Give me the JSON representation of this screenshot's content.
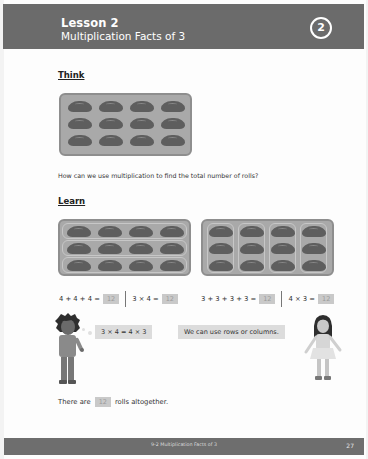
{
  "header": {
    "lesson": "Lesson 2",
    "subtitle": "Multiplication Facts of 3",
    "chapter_number": "2"
  },
  "think": {
    "title": "Think",
    "tray": {
      "rows": 3,
      "columns": 4,
      "item": "roll-icon"
    },
    "question": "How can we use multiplication to find the total number of rolls?"
  },
  "learn": {
    "title": "Learn",
    "rows_tray": {
      "rows": 3,
      "columns": 4,
      "grouping": "rows"
    },
    "columns_tray": {
      "rows": 3,
      "columns": 4,
      "grouping": "columns"
    },
    "equations_left": {
      "addition": "4 + 4 + 4 =",
      "addition_answer": "12",
      "multiplication": "3 × 4 =",
      "multiplication_answer": "12"
    },
    "equations_right": {
      "addition": "3 + 3 + 3 + 3 =",
      "addition_answer": "12",
      "multiplication": "4 × 3 =",
      "multiplication_answer": "12"
    },
    "boy_bubble": "3 × 4 = 4 × 3",
    "girl_bubble": "We can use rows or columns.",
    "sentence_before": "There are",
    "sentence_answer": "12",
    "sentence_after": "rolls altogether."
  },
  "footer": {
    "title": "9-2  Multiplication Facts of 3",
    "page_number": "27"
  },
  "colors": {
    "header_bg": "#6b6b6b",
    "tray_bg": "#a9a9a9",
    "roll": "#5e5e5e",
    "answer_box": "#c9c9c9",
    "bubble": "#dcdcdc"
  }
}
